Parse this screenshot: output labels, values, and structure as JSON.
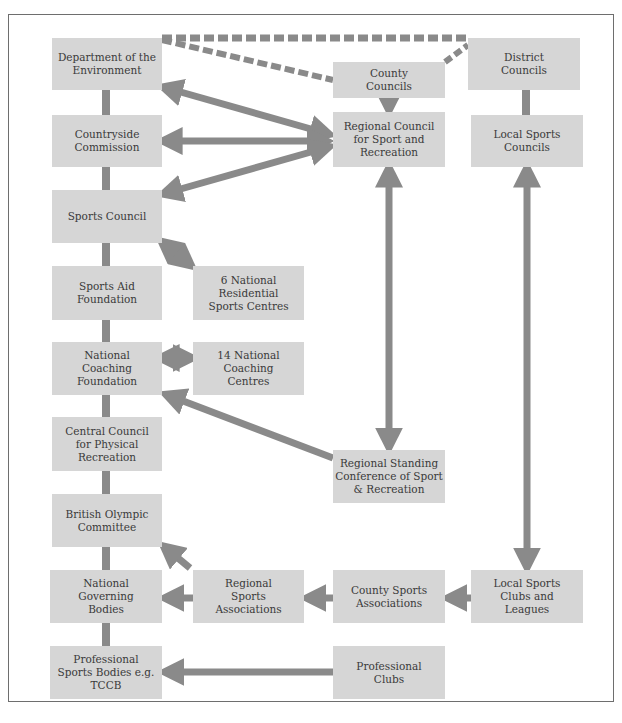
{
  "diagram": {
    "type": "organisational-chart",
    "colors": {
      "box_fill": "#d6d6d6",
      "connector": "#8a8a8a",
      "text": "#3a3a3a",
      "frame": "#6e6e6e"
    },
    "nodes": {
      "dept_env": "Department of the Environment",
      "countryside": "Countryside Commission",
      "sports_council": "Sports Council",
      "sports_aid": "Sports Aid Foundation",
      "national_coaching": "National Coaching Foundation",
      "central_council": "Central Council for Physical Recreation",
      "british_olympic": "British Olympic Committee",
      "ngb": "National Governing Bodies",
      "pro_sports_bodies": "Professional Sports Bodies e.g. TCCB",
      "six_national": "6 National Residential Sports Centres",
      "fourteen_national": "14 National Coaching Centres",
      "county_councils": "County Councils",
      "regional_council": "Regional Council for Sport and Recreation",
      "district_councils": "District Councils",
      "local_sports_councils": "Local Sports Councils",
      "regional_standing": "Regional Standing Conference of Sport & Recreation",
      "regional_sports_assoc": "Regional Sports Associations",
      "county_sports_assoc": "County Sports Associations",
      "local_sports_clubs": "Local Sports Clubs and Leagues",
      "professional_clubs": "Professional Clubs"
    },
    "edges": [
      {
        "from": "dept_env",
        "to": "district_councils",
        "style": "dashed"
      },
      {
        "from": "dept_env",
        "to": "county_councils",
        "style": "dashed"
      },
      {
        "from": "county_councils",
        "to": "district_councils",
        "style": "dashed"
      },
      {
        "from": "dept_env",
        "to": "countryside",
        "style": "solid-line"
      },
      {
        "from": "countryside",
        "to": "sports_council",
        "style": "solid-line"
      },
      {
        "from": "sports_council",
        "to": "sports_aid",
        "style": "solid-line"
      },
      {
        "from": "sports_aid",
        "to": "national_coaching",
        "style": "solid-line"
      },
      {
        "from": "national_coaching",
        "to": "central_council",
        "style": "solid-line"
      },
      {
        "from": "central_council",
        "to": "british_olympic",
        "style": "solid-line"
      },
      {
        "from": "british_olympic",
        "to": "ngb",
        "style": "solid-line"
      },
      {
        "from": "ngb",
        "to": "pro_sports_bodies",
        "style": "solid-line"
      },
      {
        "from": "district_councils",
        "to": "local_sports_councils",
        "style": "solid-line"
      },
      {
        "from": "county_councils",
        "to": "regional_council",
        "style": "arrow"
      },
      {
        "from": "regional_council",
        "to": "dept_env",
        "style": "double-arrow"
      },
      {
        "from": "regional_council",
        "to": "countryside",
        "style": "double-arrow"
      },
      {
        "from": "regional_council",
        "to": "sports_council",
        "style": "double-arrow"
      },
      {
        "from": "sports_council",
        "to": "six_national",
        "style": "double-arrow"
      },
      {
        "from": "national_coaching",
        "to": "fourteen_national",
        "style": "double-arrow"
      },
      {
        "from": "regional_council",
        "to": "regional_standing",
        "style": "double-arrow"
      },
      {
        "from": "regional_standing",
        "to": "national_coaching",
        "style": "arrow"
      },
      {
        "from": "local_sports_councils",
        "to": "local_sports_clubs",
        "style": "double-arrow"
      },
      {
        "from": "local_sports_clubs",
        "to": "county_sports_assoc",
        "style": "arrow"
      },
      {
        "from": "county_sports_assoc",
        "to": "regional_sports_assoc",
        "style": "arrow"
      },
      {
        "from": "regional_sports_assoc",
        "to": "ngb",
        "style": "arrow"
      },
      {
        "from": "regional_sports_assoc",
        "to": "british_olympic",
        "style": "arrow"
      },
      {
        "from": "professional_clubs",
        "to": "pro_sports_bodies",
        "style": "arrow"
      }
    ]
  }
}
